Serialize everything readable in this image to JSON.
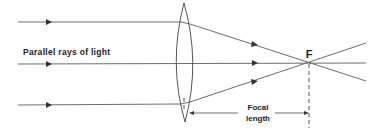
{
  "diagram": {
    "labels": {
      "parallel_rays": "Parallel rays of light",
      "focal_point": "F",
      "focal_length_line1": "Focal",
      "focal_length_line2": "length"
    },
    "colors": {
      "ray": "#6e6e6e",
      "lens": "#555555",
      "arrowhead": "#333333",
      "text": "#222222",
      "background": "#ffffff"
    },
    "elements": {
      "lens": {
        "type": "biconvex",
        "center_x": 184,
        "top_y": 3,
        "bottom_y": 122
      },
      "focal_point": {
        "x": 309,
        "y": 62
      },
      "rays": [
        {
          "name": "top",
          "incoming_y": 22
        },
        {
          "name": "middle",
          "incoming_y": 63
        },
        {
          "name": "bottom",
          "incoming_y": 105
        }
      ]
    }
  }
}
